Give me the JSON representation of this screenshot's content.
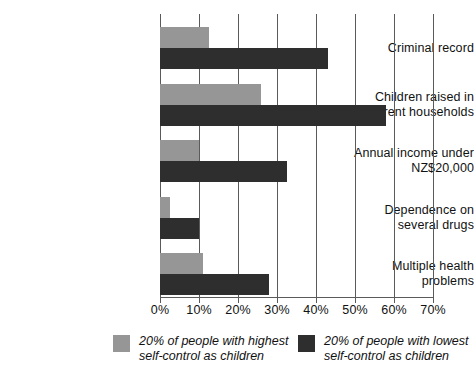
{
  "chart_data": {
    "type": "bar",
    "orientation": "horizontal",
    "title": "",
    "xlabel": "",
    "ylabel": "",
    "xlim": [
      0,
      70
    ],
    "xticks": [
      "0%",
      "10%",
      "20%",
      "30%",
      "40%",
      "50%",
      "60%",
      "70%"
    ],
    "xtick_values": [
      0,
      10,
      20,
      30,
      40,
      50,
      60,
      70
    ],
    "grid": true,
    "grid_axis": "x",
    "legend_position": "bottom",
    "categories": [
      "Criminal record",
      "Children raised in single-parent households",
      "Annual income under NZ$20,000",
      "Dependence on several drugs",
      "Multiple health problems"
    ],
    "category_lines": [
      [
        "Criminal record"
      ],
      [
        "Children raised in",
        "single-parent households"
      ],
      [
        "Annual income under",
        "NZ$20,000"
      ],
      [
        "Dependence on",
        "several drugs"
      ],
      [
        "Multiple health",
        "problems"
      ]
    ],
    "series": [
      {
        "name": "20% of people with highest self-control as children",
        "name_lines": [
          "20% of people with highest",
          "self-control as children"
        ],
        "color": "#969696",
        "values": [
          12.5,
          26,
          10,
          2.5,
          11
        ]
      },
      {
        "name": "20% of people with lowest self-control as children",
        "name_lines": [
          "20% of people with lowest",
          "self-control as children"
        ],
        "color": "#2e2e2e",
        "values": [
          43,
          58,
          32.5,
          10,
          28
        ]
      }
    ]
  },
  "axis": {
    "line_color": "#5a5a5a"
  }
}
